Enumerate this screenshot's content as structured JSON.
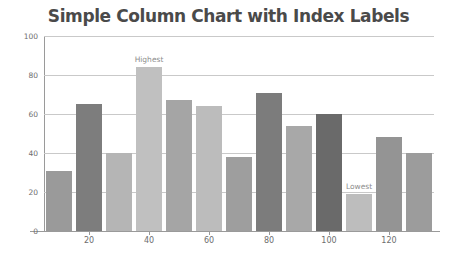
{
  "chart_data": {
    "type": "bar",
    "title": "Simple Column Chart with Index Labels",
    "xlabel": "",
    "ylabel": "",
    "ylim": [
      0,
      100
    ],
    "xlim": [
      5,
      135
    ],
    "grid": true,
    "legend": "none",
    "y_ticks": [
      0,
      20,
      40,
      60,
      80,
      100
    ],
    "y_tick_labels": [
      "0",
      "20",
      "40",
      "60",
      "80",
      "100"
    ],
    "x_ticks": [
      20,
      40,
      60,
      80,
      100,
      120
    ],
    "x_tick_labels": [
      "20",
      "40",
      "60",
      "80",
      "100",
      "120"
    ],
    "x": [
      10,
      20,
      30,
      40,
      50,
      60,
      70,
      80,
      90,
      100,
      110,
      120,
      130
    ],
    "values": [
      31,
      65,
      40,
      84,
      67,
      64,
      38,
      71,
      54,
      60,
      19,
      48,
      40
    ],
    "colors": [
      "#9a9a9a",
      "#7d7d7d",
      "#b5b5b5",
      "#c0c0c0",
      "#a5a5a5",
      "#bcbcbc",
      "#9e9e9e",
      "#7c7c7c",
      "#a8a8a8",
      "#6a6a6a",
      "#bdbdbd",
      "#949494",
      "#9c9c9c"
    ],
    "annotations": [
      {
        "label": "Highest",
        "index": 3,
        "value": 84
      },
      {
        "label": "Lowest",
        "index": 10,
        "value": 19
      }
    ],
    "style": {
      "title_color": "#4a4a4a",
      "gridline_color": "#c9c9c9",
      "axis_color": "#9a9a9a",
      "tick_label_color": "#6d6d6d",
      "index_label_color": "#8d8d8d",
      "background": "#ffffff"
    }
  }
}
